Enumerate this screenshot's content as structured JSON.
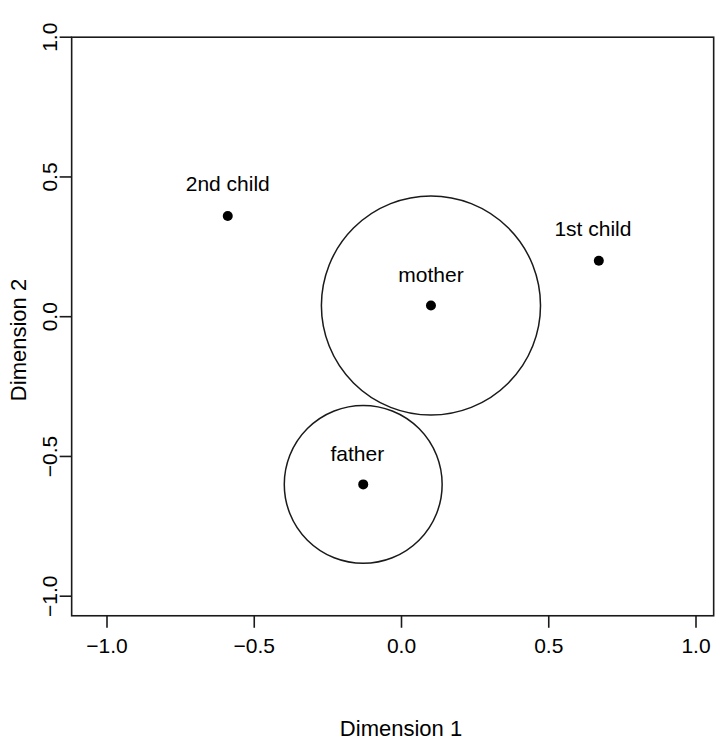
{
  "chart_data": {
    "type": "scatter",
    "title": "",
    "xlabel": "Dimension 1",
    "ylabel": "Dimension 2",
    "xlim": [
      -1.12,
      1.06
    ],
    "ylim": [
      -1.07,
      1.0
    ],
    "grid": false,
    "legend": null,
    "xticks": [
      -1.0,
      -0.5,
      0.0,
      0.5,
      1.0
    ],
    "yticks": [
      -1.0,
      -0.5,
      0.0,
      0.5,
      1.0
    ],
    "xtick_labels": [
      "-1.0",
      "-0.5",
      "0.0",
      "0.5",
      "1.0"
    ],
    "ytick_labels": [
      "-1.0",
      "-0.5",
      "0.0",
      "0.5",
      "1.0"
    ],
    "points": [
      {
        "label": "2nd child",
        "x": -0.59,
        "y": 0.36,
        "label_dx": 0.0,
        "label_dy": 0.09,
        "radius": 0
      },
      {
        "label": "1st child",
        "x": 0.67,
        "y": 0.2,
        "label_dx": -0.02,
        "label_dy": 0.09,
        "radius": 0
      },
      {
        "label": "mother",
        "x": 0.1,
        "y": 0.04,
        "label_dx": 0.0,
        "label_dy": 0.085,
        "radius": 0.372
      },
      {
        "label": "father",
        "x": -0.13,
        "y": -0.6,
        "label_dx": -0.02,
        "label_dy": 0.085,
        "radius": 0.268
      }
    ],
    "point_marker": "filled-circle",
    "point_marker_size": 5,
    "circle_stroke": "#1a1a1a",
    "point_color": "#000000",
    "axis_color": "#1a1a1a",
    "background": "#ffffff"
  }
}
